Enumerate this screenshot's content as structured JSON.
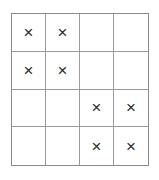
{
  "figure": {
    "rows": 4,
    "columns": 4,
    "mark_glyph": "×",
    "empty_glyph": "",
    "colors": {
      "background": "#ffffff",
      "outer_border": "#8a8a8a",
      "grid_line": "#9a9a9a",
      "mark": "#2b2b2b"
    },
    "cells": [
      [
        {
          "mark": "×",
          "filled": true
        },
        {
          "mark": "×",
          "filled": true
        },
        {
          "mark": "",
          "filled": false
        },
        {
          "mark": "",
          "filled": false
        }
      ],
      [
        {
          "mark": "×",
          "filled": true
        },
        {
          "mark": "×",
          "filled": true
        },
        {
          "mark": "",
          "filled": false
        },
        {
          "mark": "",
          "filled": false
        }
      ],
      [
        {
          "mark": "",
          "filled": false
        },
        {
          "mark": "",
          "filled": false
        },
        {
          "mark": "×",
          "filled": true
        },
        {
          "mark": "×",
          "filled": true
        }
      ],
      [
        {
          "mark": "",
          "filled": false
        },
        {
          "mark": "",
          "filled": false
        },
        {
          "mark": "×",
          "filled": true
        },
        {
          "mark": "×",
          "filled": true
        }
      ]
    ]
  }
}
